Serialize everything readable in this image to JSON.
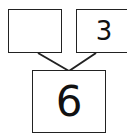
{
  "number_bond": {
    "part_left": "",
    "part_right": "3",
    "whole": "6"
  },
  "colors": {
    "stroke": "#222222",
    "background": "#ffffff"
  }
}
